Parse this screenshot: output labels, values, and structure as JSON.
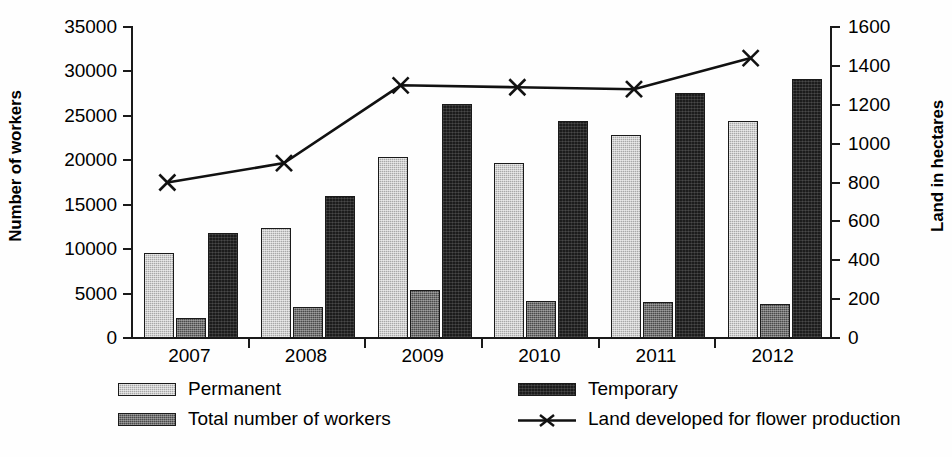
{
  "chart_data": {
    "type": "bar",
    "title": "",
    "subtitle": "",
    "xlabel": "",
    "ylabel": "Number of workers",
    "y2label": "Land in hectares",
    "categories": [
      "2007",
      "2008",
      "2009",
      "2010",
      "2011",
      "2012"
    ],
    "ylim": [
      0,
      35000
    ],
    "y_ticks": [
      0,
      5000,
      10000,
      15000,
      20000,
      25000,
      30000,
      35000
    ],
    "y_tick_labels": [
      "0",
      "5000",
      "10000",
      "15000",
      "20000",
      "25000",
      "30000",
      "35000"
    ],
    "y2lim": [
      0,
      1600
    ],
    "y2_ticks": [
      0,
      200,
      400,
      600,
      800,
      1000,
      1200,
      1400,
      1600
    ],
    "y2_tick_labels": [
      "0",
      "200",
      "400",
      "600",
      "800",
      "1000",
      "1200",
      "1400",
      "1600"
    ],
    "grid": false,
    "legend_position": "bottom",
    "series": [
      {
        "name": "Permanent",
        "kind": "bar",
        "axis": "left",
        "color": "#a8a8a8",
        "values": [
          9600,
          12400,
          20400,
          19700,
          22800,
          24400
        ]
      },
      {
        "name": "Total number of workers",
        "kind": "bar",
        "axis": "left",
        "color": "#4a4a4a",
        "values": [
          2300,
          3500,
          5400,
          4200,
          4000,
          3800
        ]
      },
      {
        "name": "Temporary",
        "kind": "bar",
        "axis": "left",
        "color": "#1c1c1c",
        "values": [
          11800,
          16000,
          26300,
          24400,
          27600,
          29200
        ]
      },
      {
        "name": "Land developed for flower production",
        "kind": "line",
        "axis": "right",
        "color": "#111111",
        "marker": "x",
        "values": [
          800,
          900,
          1300,
          1290,
          1280,
          1440
        ]
      }
    ]
  },
  "axes": {
    "left_title": "Number of workers",
    "right_title": "Land in hectares"
  },
  "legend": {
    "items": [
      {
        "label": "Permanent",
        "swatch": "bar-permanent"
      },
      {
        "label": "Temporary",
        "swatch": "bar-temporary"
      },
      {
        "label": "Total number of workers",
        "swatch": "bar-total"
      },
      {
        "label": "Land developed for flower production",
        "swatch": "line-x"
      }
    ]
  },
  "colors": {
    "permanent": "#a8a8a8",
    "total": "#4a4a4a",
    "temporary": "#1c1c1c",
    "line": "#111111",
    "axis": "#1a1a1a",
    "background": "#fefefe"
  }
}
